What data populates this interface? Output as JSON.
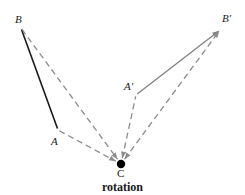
{
  "figure": {
    "caption": "rotation",
    "width": 245,
    "height": 195,
    "background": "#ffffff",
    "colors": {
      "solid_original": "#1a1a1a",
      "solid_image": "#808080",
      "dashed": "#8c8c8c",
      "center_dot": "#000000",
      "label_text": "#1a1a1a"
    },
    "points": [
      {
        "id": "B",
        "label": "B",
        "x": 21,
        "y": 28,
        "label_x": 15,
        "label_y": 14,
        "style": "italic"
      },
      {
        "id": "A",
        "label": "A",
        "x": 58,
        "y": 130,
        "label_x": 51,
        "label_y": 136,
        "style": "italic"
      },
      {
        "id": "C",
        "label": "C",
        "x": 121,
        "y": 164,
        "label_x": 117,
        "label_y": 168,
        "style": "upright"
      },
      {
        "id": "Aprime",
        "label": "A'",
        "x": 136,
        "y": 95,
        "label_x": 124,
        "label_y": 81,
        "style": "italic"
      },
      {
        "id": "Bprime",
        "label": "B'",
        "x": 220,
        "y": 30,
        "label_x": 222,
        "label_y": 13,
        "style": "italic"
      }
    ],
    "segments": [
      {
        "id": "segment-BA",
        "from": "B",
        "to": "A",
        "style": "solid",
        "color": "#1a1a1a",
        "width": 1.6,
        "arrow": "none"
      },
      {
        "id": "segment-AprimeBprime",
        "from": "Aprime",
        "to": "Bprime",
        "style": "solid",
        "color": "#808080",
        "width": 1.3,
        "arrow": "end"
      },
      {
        "id": "segment-BC",
        "from": "B",
        "to": "C",
        "style": "dashed",
        "color": "#8c8c8c",
        "width": 1.3,
        "arrow": "end"
      },
      {
        "id": "segment-AC",
        "from": "A",
        "to": "C",
        "style": "dashed",
        "color": "#8c8c8c",
        "width": 1.3,
        "arrow": "end"
      },
      {
        "id": "segment-CAprime",
        "from": "C",
        "to": "Aprime",
        "style": "dashed",
        "color": "#8c8c8c",
        "width": 1.3,
        "arrow": "start"
      },
      {
        "id": "segment-CBprime",
        "from": "C",
        "to": "Bprime",
        "style": "dashed",
        "color": "#8c8c8c",
        "width": 1.3,
        "arrow": "both"
      }
    ],
    "center_point": {
      "id": "C",
      "x": 121,
      "y": 164,
      "radius": 4.2
    }
  }
}
